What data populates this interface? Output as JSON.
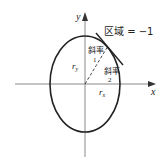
{
  "diagram": {
    "type": "ellipse-tangent-slope",
    "axes": {
      "x_label": "x",
      "y_label": "y",
      "color": "#999999"
    },
    "ellipse": {
      "center": [
        85,
        84
      ],
      "rx": 35,
      "ry": 48,
      "stroke": "#222222"
    },
    "labels": {
      "region": "区域 = −1",
      "slope1_text": "斜率",
      "slope1_num": "1",
      "slope2_text": "斜率",
      "slope2_num": "2",
      "ry": "r",
      "ry_sub": "y",
      "rx": "r",
      "rx_sub": "x"
    }
  }
}
